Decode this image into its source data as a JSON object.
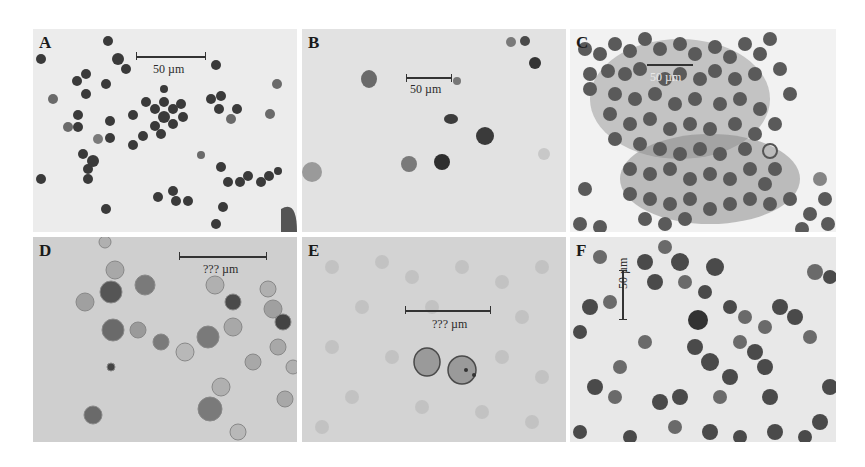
{
  "figure": {
    "panels": [
      {
        "id": "A",
        "label": "A",
        "scale_text": "50 µm",
        "background": "#ececec",
        "description": "Scattered dark-stained round cells on light background"
      },
      {
        "id": "B",
        "label": "B",
        "scale_text": "50 µm",
        "background": "#e2e2e2",
        "description": "Sparse few stained cells on light gray background"
      },
      {
        "id": "C",
        "label": "C",
        "scale_text": "50 µm",
        "background": "#f2f2f2",
        "description": "Dense clusters of dark-stained cells"
      },
      {
        "id": "D",
        "label": "D",
        "scale_text": "??? µm",
        "background": "#cfcfcf",
        "description": "Round cells with granular staining on gray textured background"
      },
      {
        "id": "E",
        "label": "E",
        "scale_text": "??? µm",
        "background": "#d3d3d3",
        "description": "Two outlined cells on mottled gray background"
      },
      {
        "id": "F",
        "label": "F",
        "scale_text": "50 µm",
        "background": "#e8e8e8",
        "description": "Dense dark-stained cells with vertical scale bar"
      }
    ]
  }
}
